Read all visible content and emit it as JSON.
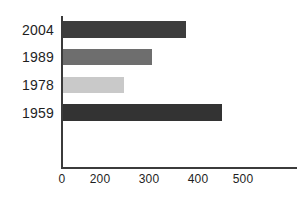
{
  "chart_data": {
    "type": "bar",
    "orientation": "horizontal",
    "title": "",
    "xlabel": "",
    "ylabel": "",
    "categories": [
      "2004",
      "1989",
      "1978",
      "1959"
    ],
    "values": [
      380,
      310,
      250,
      455
    ],
    "series": [
      {
        "name": "",
        "values": [
          380,
          310,
          250,
          455
        ]
      }
    ],
    "bar_colors": [
      "#3d3d3d",
      "#6e6e6e",
      "#c9c9c9",
      "#333333"
    ],
    "xlim": [
      0,
      560
    ],
    "xticks": [
      "0",
      "200",
      "300",
      "400",
      "500"
    ],
    "xtick_values": [
      0,
      200,
      300,
      400,
      500
    ],
    "grid": false,
    "legend": "none",
    "axis_color": "#3b3b3b",
    "background": "#ffffff"
  },
  "axis": {
    "tick_0": "0",
    "tick_200": "200",
    "tick_300": "300",
    "tick_400": "400",
    "tick_500": "500"
  },
  "categories": {
    "c0": "2004",
    "c1": "1989",
    "c2": "1978",
    "c3": "1959"
  }
}
